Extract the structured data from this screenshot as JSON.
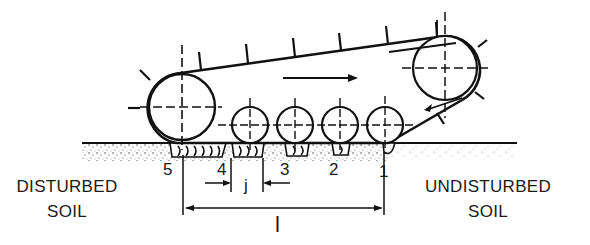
{
  "diagram": {
    "direction_arrow": "right",
    "labels": {
      "disturbed_soil_line1": "DISTURBED",
      "disturbed_soil_line2": "SOIL",
      "undisturbed_soil_line1": "UNDISTURBED",
      "undisturbed_soil_line2": "SOIL"
    },
    "impressions": [
      {
        "id": "5",
        "label": "5"
      },
      {
        "id": "4",
        "label": "4"
      },
      {
        "id": "3",
        "label": "3"
      },
      {
        "id": "2",
        "label": "2"
      },
      {
        "id": "1",
        "label": "1"
      }
    ],
    "dimensions": {
      "gap_label": "j",
      "length_label": "l"
    },
    "components": {
      "rear_sprocket": "large left wheel",
      "front_idler": "upper right wheel",
      "road_wheels": 4
    },
    "colors": {
      "ink": "#111111",
      "background": "#ffffff"
    }
  }
}
